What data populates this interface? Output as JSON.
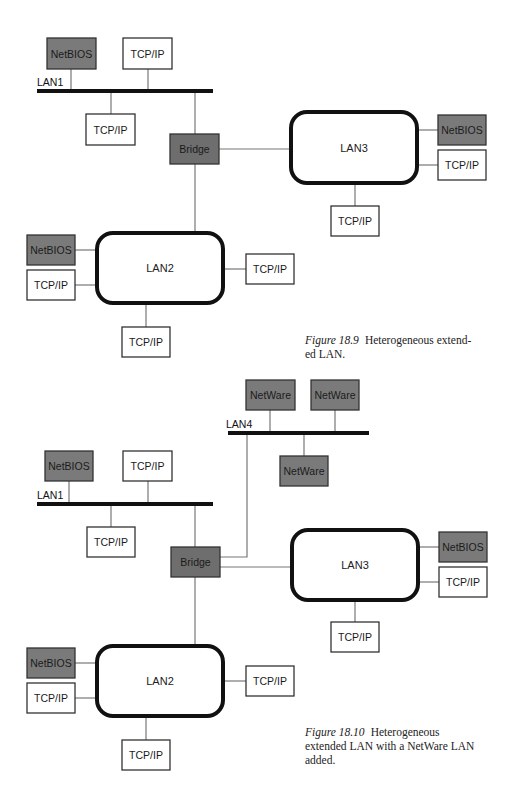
{
  "colors": {
    "shaded_fill": "#7a7a7a",
    "white_fill": "#ffffff",
    "box_stroke": "#333333",
    "bus_stroke": "#111111",
    "link_stroke": "#777777",
    "lan_stroke": "#111111"
  },
  "figures": [
    {
      "id": "fig-18-9",
      "caption": {
        "number": "Figure 18.9",
        "text": "Heterogeneous extend-ed LAN.",
        "lines": [
          "Heterogeneous extend-",
          "ed LAN."
        ],
        "x": 305,
        "y": 333,
        "width": 200
      },
      "buses": [
        {
          "id": "lan1-bus",
          "label": "LAN1",
          "x1": 37,
          "x2": 213,
          "y": 91,
          "label_x": 37,
          "label_y": 86
        }
      ],
      "lans": [
        {
          "id": "lan3",
          "label": "LAN3",
          "x": 291,
          "y": 112,
          "w": 126,
          "h": 71
        },
        {
          "id": "lan2",
          "label": "LAN2",
          "x": 97,
          "y": 233,
          "w": 126,
          "h": 70
        }
      ],
      "nodes": [
        {
          "id": "netbios-lan1",
          "label": "NetBIOS",
          "type": "shaded",
          "x": 47,
          "y": 38,
          "w": 49,
          "h": 31
        },
        {
          "id": "tcpip-lan1-top",
          "label": "TCP/IP",
          "type": "white",
          "x": 123,
          "y": 38,
          "w": 49,
          "h": 31
        },
        {
          "id": "tcpip-lan1-bottom",
          "label": "TCP/IP",
          "type": "white",
          "x": 86,
          "y": 114,
          "w": 49,
          "h": 31
        },
        {
          "id": "bridge",
          "label": "Bridge",
          "type": "bridge",
          "x": 170,
          "y": 134,
          "w": 49,
          "h": 30
        },
        {
          "id": "netbios-lan3",
          "label": "NetBIOS",
          "type": "shaded",
          "x": 438,
          "y": 115,
          "w": 48,
          "h": 30
        },
        {
          "id": "tcpip-lan3-right",
          "label": "TCP/IP",
          "type": "white",
          "x": 438,
          "y": 150,
          "w": 48,
          "h": 30
        },
        {
          "id": "tcpip-lan3-bottom",
          "label": "TCP/IP",
          "type": "white",
          "x": 331,
          "y": 206,
          "w": 48,
          "h": 30
        },
        {
          "id": "netbios-lan2",
          "label": "NetBIOS",
          "type": "shaded",
          "x": 27,
          "y": 235,
          "w": 48,
          "h": 30
        },
        {
          "id": "tcpip-lan2-left",
          "label": "TCP/IP",
          "type": "white",
          "x": 27,
          "y": 270,
          "w": 48,
          "h": 30
        },
        {
          "id": "tcpip-lan2-right",
          "label": "TCP/IP",
          "type": "white",
          "x": 246,
          "y": 254,
          "w": 48,
          "h": 30
        },
        {
          "id": "tcpip-lan2-bottom",
          "label": "TCP/IP",
          "type": "white",
          "x": 122,
          "y": 327,
          "w": 48,
          "h": 30
        }
      ],
      "links": [
        {
          "points": [
            [
              71,
              69
            ],
            [
              71,
              91
            ]
          ]
        },
        {
          "points": [
            [
              148,
              69
            ],
            [
              148,
              91
            ]
          ]
        },
        {
          "points": [
            [
              111,
              91
            ],
            [
              111,
              114
            ]
          ]
        },
        {
          "points": [
            [
              195,
              91
            ],
            [
              195,
              134
            ]
          ]
        },
        {
          "points": [
            [
              219,
              149
            ],
            [
              291,
              149
            ]
          ]
        },
        {
          "points": [
            [
              195,
              164
            ],
            [
              195,
              233
            ]
          ]
        },
        {
          "points": [
            [
              417,
              130
            ],
            [
              438,
              130
            ]
          ]
        },
        {
          "points": [
            [
              417,
              165
            ],
            [
              438,
              165
            ]
          ]
        },
        {
          "points": [
            [
              355,
              183
            ],
            [
              355,
              206
            ]
          ]
        },
        {
          "points": [
            [
              75,
              250
            ],
            [
              97,
              250
            ]
          ]
        },
        {
          "points": [
            [
              75,
              285
            ],
            [
              97,
              285
            ]
          ]
        },
        {
          "points": [
            [
              223,
              269
            ],
            [
              246,
              269
            ]
          ]
        },
        {
          "points": [
            [
              146,
              303
            ],
            [
              146,
              327
            ]
          ]
        }
      ]
    },
    {
      "id": "fig-18-10",
      "caption": {
        "number": "Figure 18.10",
        "text": "Heterogeneous extended LAN with a NetWare LAN added.",
        "lines": [
          "Heterogeneous",
          "extended LAN with a NetWare LAN",
          "added."
        ],
        "x": 305,
        "y": 725,
        "width": 205
      },
      "buses": [
        {
          "id": "lan4-bus",
          "label": "LAN4",
          "x1": 228,
          "x2": 369,
          "y": 433,
          "label_x": 226,
          "label_y": 428
        },
        {
          "id": "lan1-bus",
          "label": "LAN1",
          "x1": 37,
          "x2": 213,
          "y": 504,
          "label_x": 37,
          "label_y": 499
        }
      ],
      "lans": [
        {
          "id": "lan3",
          "label": "LAN3",
          "x": 292,
          "y": 530,
          "w": 126,
          "h": 70
        },
        {
          "id": "lan2",
          "label": "LAN2",
          "x": 97,
          "y": 646,
          "w": 126,
          "h": 70
        }
      ],
      "nodes": [
        {
          "id": "netware-1",
          "label": "NetWare",
          "type": "shaded",
          "x": 246,
          "y": 380,
          "w": 49,
          "h": 30
        },
        {
          "id": "netware-2",
          "label": "NetWare",
          "type": "shaded",
          "x": 311,
          "y": 380,
          "w": 48,
          "h": 30
        },
        {
          "id": "netware-3",
          "label": "NetWare",
          "type": "shaded",
          "x": 280,
          "y": 456,
          "w": 48,
          "h": 30
        },
        {
          "id": "netbios-lan1",
          "label": "NetBIOS",
          "type": "shaded",
          "x": 45,
          "y": 451,
          "w": 48,
          "h": 30
        },
        {
          "id": "tcpip-lan1-top",
          "label": "TCP/IP",
          "type": "white",
          "x": 123,
          "y": 451,
          "w": 49,
          "h": 30
        },
        {
          "id": "tcpip-lan1-bottom",
          "label": "TCP/IP",
          "type": "white",
          "x": 87,
          "y": 527,
          "w": 48,
          "h": 30
        },
        {
          "id": "bridge",
          "label": "Bridge",
          "type": "bridge",
          "x": 171,
          "y": 547,
          "w": 49,
          "h": 30
        },
        {
          "id": "netbios-lan3",
          "label": "NetBIOS",
          "type": "shaded",
          "x": 439,
          "y": 532,
          "w": 48,
          "h": 30
        },
        {
          "id": "tcpip-lan3-right",
          "label": "TCP/IP",
          "type": "white",
          "x": 439,
          "y": 567,
          "w": 48,
          "h": 30
        },
        {
          "id": "tcpip-lan3-bottom",
          "label": "TCP/IP",
          "type": "white",
          "x": 331,
          "y": 622,
          "w": 48,
          "h": 30
        },
        {
          "id": "netbios-lan2",
          "label": "NetBIOS",
          "type": "shaded",
          "x": 27,
          "y": 648,
          "w": 48,
          "h": 30
        },
        {
          "id": "tcpip-lan2-left",
          "label": "TCP/IP",
          "type": "white",
          "x": 27,
          "y": 683,
          "w": 48,
          "h": 30
        },
        {
          "id": "tcpip-lan2-right",
          "label": "TCP/IP",
          "type": "white",
          "x": 246,
          "y": 666,
          "w": 48,
          "h": 30
        },
        {
          "id": "tcpip-lan2-bottom",
          "label": "TCP/IP",
          "type": "white",
          "x": 122,
          "y": 740,
          "w": 48,
          "h": 30
        }
      ],
      "links": [
        {
          "points": [
            [
              270,
              410
            ],
            [
              270,
              433
            ]
          ]
        },
        {
          "points": [
            [
              335,
              410
            ],
            [
              335,
              433
            ]
          ]
        },
        {
          "points": [
            [
              304,
              433
            ],
            [
              304,
              456
            ]
          ]
        },
        {
          "points": [
            [
              247,
              433
            ],
            [
              247,
              557
            ],
            [
              220,
              557
            ]
          ]
        },
        {
          "points": [
            [
              69,
              481
            ],
            [
              69,
              504
            ]
          ]
        },
        {
          "points": [
            [
              148,
              481
            ],
            [
              148,
              504
            ]
          ]
        },
        {
          "points": [
            [
              111,
              504
            ],
            [
              111,
              527
            ]
          ]
        },
        {
          "points": [
            [
              195,
              504
            ],
            [
              195,
              547
            ]
          ]
        },
        {
          "points": [
            [
              220,
              567
            ],
            [
              292,
              567
            ]
          ]
        },
        {
          "points": [
            [
              195,
              577
            ],
            [
              195,
              646
            ]
          ]
        },
        {
          "points": [
            [
              418,
              547
            ],
            [
              439,
              547
            ]
          ]
        },
        {
          "points": [
            [
              418,
              582
            ],
            [
              439,
              582
            ]
          ]
        },
        {
          "points": [
            [
              355,
              600
            ],
            [
              355,
              622
            ]
          ]
        },
        {
          "points": [
            [
              75,
              663
            ],
            [
              97,
              663
            ]
          ]
        },
        {
          "points": [
            [
              75,
              698
            ],
            [
              97,
              698
            ]
          ]
        },
        {
          "points": [
            [
              223,
              681
            ],
            [
              246,
              681
            ]
          ]
        },
        {
          "points": [
            [
              146,
              716
            ],
            [
              146,
              740
            ]
          ]
        }
      ]
    }
  ]
}
